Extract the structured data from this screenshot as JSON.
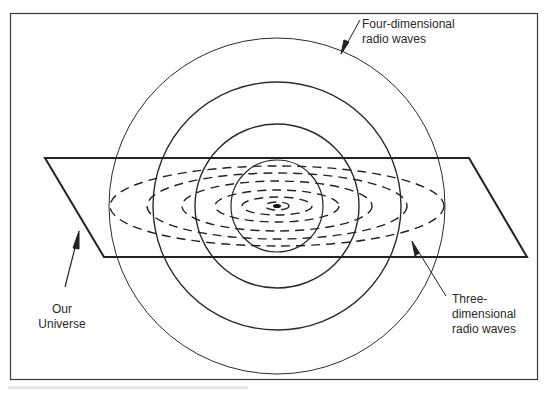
{
  "diagram": {
    "labels": {
      "four_d_line1": "Four-dimensional",
      "four_d_line2": "radio waves",
      "universe_line1": "Our",
      "universe_line2": "Universe",
      "three_d_line1": "Three-",
      "three_d_line2": "dimensional",
      "three_d_line3": "radio waves"
    },
    "colors": {
      "ink": "#2a2a2a",
      "background": "#ffffff"
    },
    "geometry": {
      "center": [
        277,
        206
      ],
      "circle_radii": [
        46,
        82,
        124,
        168
      ],
      "plane": {
        "top_left": [
          45,
          158
        ],
        "top_right": [
          469,
          158
        ],
        "bottom_right": [
          527,
          257
        ],
        "bottom_left": [
          104,
          257
        ]
      },
      "ellipses_rx_ry": [
        [
          12,
          4
        ],
        [
          35,
          9
        ],
        [
          62,
          16
        ],
        [
          95,
          25
        ],
        [
          130,
          33
        ],
        [
          167,
          40
        ]
      ]
    }
  }
}
